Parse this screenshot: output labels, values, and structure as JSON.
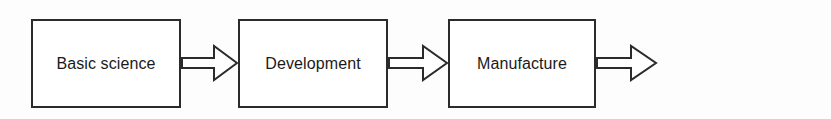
{
  "diagram": {
    "type": "linear-process-flow",
    "title": "",
    "orientation": "left-to-right",
    "background_color": "#fdfdfd",
    "box_fill_color": "#ffffff",
    "box_border_color": "#2b2b2b",
    "arrow_fill_color": "#ffffff",
    "arrow_border_color": "#2b2b2b",
    "text_color": "#1a1a1a",
    "stages": [
      {
        "id": "basic-science",
        "label": "Basic science",
        "x": 31,
        "y": 19,
        "width": 150,
        "height": 89
      },
      {
        "id": "development",
        "label": "Development",
        "x": 238,
        "y": 19,
        "width": 150,
        "height": 89
      },
      {
        "id": "manufacture",
        "label": "Manufacture",
        "x": 448,
        "y": 19,
        "width": 148,
        "height": 89
      },
      {
        "id": "marketing",
        "label": "Marketing",
        "x": 657,
        "y": 19,
        "width": 149,
        "height": 89
      }
    ],
    "connectors": [
      {
        "id": "basic-science-to-development",
        "from": "basic-science",
        "to": "development",
        "x": 181,
        "y": 44,
        "width": 57,
        "height": 38
      },
      {
        "id": "development-to-manufacture",
        "from": "development",
        "to": "manufacture",
        "x": 388,
        "y": 44,
        "width": 60,
        "height": 38
      },
      {
        "id": "manufacture-to-marketing",
        "from": "manufacture",
        "to": "marketing",
        "x": 596,
        "y": 44,
        "width": 61,
        "height": 38
      }
    ]
  }
}
